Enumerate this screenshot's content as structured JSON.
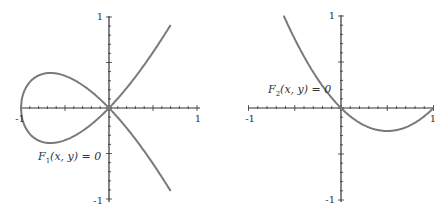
{
  "chart_data": [
    {
      "type": "line",
      "title": "",
      "annotation": "F1(x, y) = 0",
      "annotation_parts": {
        "F": "F",
        "sub": "1",
        "args": "(x, y) = 0"
      },
      "equation_hint": "y^2 = x^2 (x + 1)",
      "xlim": [
        -1,
        1
      ],
      "ylim": [
        -1,
        1
      ],
      "x_tick_labels": [
        "-1",
        "1"
      ],
      "y_tick_labels": [
        "1",
        "-1"
      ],
      "grid": false,
      "series": [
        {
          "name": "upper branch",
          "x": [
            -1,
            -0.9,
            -0.8,
            -0.67,
            -0.5,
            -0.3,
            0,
            0.2,
            0.4,
            0.55,
            0.7
          ],
          "y": [
            0,
            0.28,
            0.36,
            0.385,
            0.35,
            0.25,
            0,
            0.22,
            0.47,
            0.69,
            0.91
          ]
        },
        {
          "name": "lower branch",
          "x": [
            -1,
            -0.9,
            -0.8,
            -0.67,
            -0.5,
            -0.3,
            0,
            0.2,
            0.4,
            0.55,
            0.7
          ],
          "y": [
            0,
            -0.28,
            -0.36,
            -0.385,
            -0.35,
            -0.25,
            0,
            -0.22,
            -0.47,
            -0.69,
            -0.91
          ]
        }
      ]
    },
    {
      "type": "line",
      "title": "",
      "annotation": "F2(x, y) = 0",
      "annotation_parts": {
        "F": "F",
        "sub": "2",
        "args": "(x, y) = 0"
      },
      "equation_hint": "y = x^2 - x",
      "xlim": [
        -1,
        1
      ],
      "ylim": [
        -1,
        1
      ],
      "x_tick_labels": [
        "-1",
        "1"
      ],
      "y_tick_labels": [
        "1",
        "-1"
      ],
      "grid": false,
      "series": [
        {
          "name": "curve",
          "x": [
            -0.62,
            -0.5,
            -0.25,
            0,
            0.25,
            0.5,
            0.75,
            1
          ],
          "y": [
            1.0,
            0.75,
            0.31,
            0,
            -0.19,
            -0.25,
            -0.19,
            0
          ]
        }
      ]
    }
  ]
}
